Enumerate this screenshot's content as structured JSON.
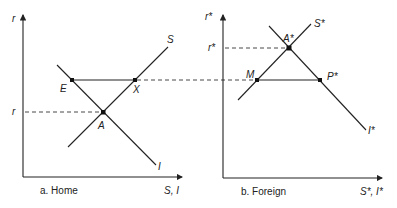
{
  "diagram": {
    "panels": [
      {
        "id": "home",
        "caption": "a. Home",
        "y_axis_label": "r",
        "x_axis_label": "S, I",
        "rate_label": "r",
        "curves": [
          {
            "name": "S",
            "label": "S"
          },
          {
            "name": "I",
            "label": "I"
          }
        ],
        "points": [
          {
            "name": "E",
            "label": "E"
          },
          {
            "name": "X",
            "label": "X"
          },
          {
            "name": "A",
            "label": "A"
          }
        ]
      },
      {
        "id": "foreign",
        "caption": "b. Foreign",
        "y_axis_label": "r*",
        "x_axis_label": "S*, I*",
        "rate_label": "r*",
        "curves": [
          {
            "name": "S*",
            "label": "S*"
          },
          {
            "name": "I*",
            "label": "I*"
          }
        ],
        "points": [
          {
            "name": "A*",
            "label": "A*"
          },
          {
            "name": "M",
            "label": "M"
          },
          {
            "name": "P*",
            "label": "P*"
          }
        ]
      }
    ]
  }
}
